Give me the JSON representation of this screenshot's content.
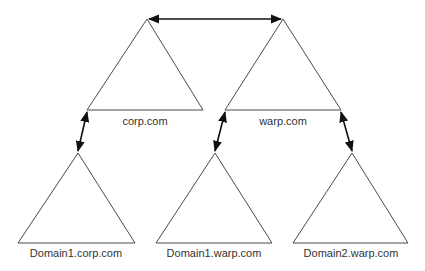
{
  "diagram": {
    "type": "domain-tree-trust",
    "colors": {
      "stroke": "#4a4a4a",
      "arrow": "#111111",
      "text": "#333333",
      "background": "#ffffff"
    },
    "nodes": [
      {
        "id": "corp",
        "label": "corp.com",
        "apex": [
          147,
          19
        ],
        "base_left": [
          87,
          110
        ],
        "base_right": [
          203,
          110
        ],
        "label_pos": [
          145,
          125
        ]
      },
      {
        "id": "warp",
        "label": "warp.com",
        "apex": [
          283,
          19
        ],
        "base_left": [
          225,
          110
        ],
        "base_right": [
          341,
          110
        ],
        "label_pos": [
          283,
          125
        ]
      },
      {
        "id": "d1corp",
        "label": "Domain1.corp.com",
        "apex": [
          78,
          153
        ],
        "base_left": [
          18,
          243
        ],
        "base_right": [
          135,
          243
        ],
        "label_pos": [
          76,
          257
        ]
      },
      {
        "id": "d1warp",
        "label": "Domain1.warp.com",
        "apex": [
          215,
          153
        ],
        "base_left": [
          156,
          243
        ],
        "base_right": [
          272,
          243
        ],
        "label_pos": [
          214,
          257
        ]
      },
      {
        "id": "d2warp",
        "label": "Domain2.warp.com",
        "apex": [
          352,
          153
        ],
        "base_left": [
          293,
          243
        ],
        "base_right": [
          408,
          243
        ],
        "label_pos": [
          351,
          257
        ]
      }
    ],
    "edges": [
      {
        "from": "corp",
        "to": "warp",
        "bidirectional": true,
        "start": [
          149,
          19
        ],
        "end": [
          281,
          19
        ]
      },
      {
        "from": "corp",
        "to": "d1corp",
        "bidirectional": true,
        "start": [
          87,
          112
        ],
        "end": [
          78,
          151
        ]
      },
      {
        "from": "warp",
        "to": "d1warp",
        "bidirectional": true,
        "start": [
          225,
          112
        ],
        "end": [
          215,
          151
        ]
      },
      {
        "from": "warp",
        "to": "d2warp",
        "bidirectional": true,
        "start": [
          341,
          112
        ],
        "end": [
          352,
          151
        ]
      }
    ]
  }
}
